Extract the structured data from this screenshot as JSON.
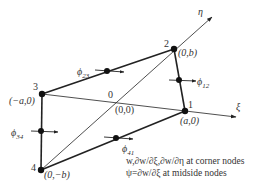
{
  "diagram": {
    "colors": {
      "line": "#222222",
      "text": "#333333",
      "background": "#ffffff"
    },
    "axes": {
      "xi": {
        "label": "ξ"
      },
      "eta": {
        "label": "η"
      }
    },
    "origin": {
      "number": "0",
      "coords": "(0,0)"
    },
    "nodes": [
      {
        "id": "1",
        "number": "1",
        "coords": "(a,0)"
      },
      {
        "id": "2",
        "number": "2",
        "coords": "(0,b)"
      },
      {
        "id": "3",
        "number": "3",
        "coords": "(−a,0)"
      },
      {
        "id": "4",
        "number": "4",
        "coords": "(0,−b)"
      }
    ],
    "midside_nodes": [
      {
        "id": "12",
        "symbol": "ϕ",
        "subscript": "12"
      },
      {
        "id": "23",
        "symbol": "ϕ",
        "subscript": "23"
      },
      {
        "id": "34",
        "symbol": "ϕ",
        "subscript": "34"
      },
      {
        "id": "41",
        "symbol": "ϕ",
        "subscript": "41"
      }
    ],
    "notes": [
      "w,∂w/∂ξ,∂w/∂η at corner nodes",
      "ψ=∂w/∂ξ at midside nodes"
    ]
  }
}
